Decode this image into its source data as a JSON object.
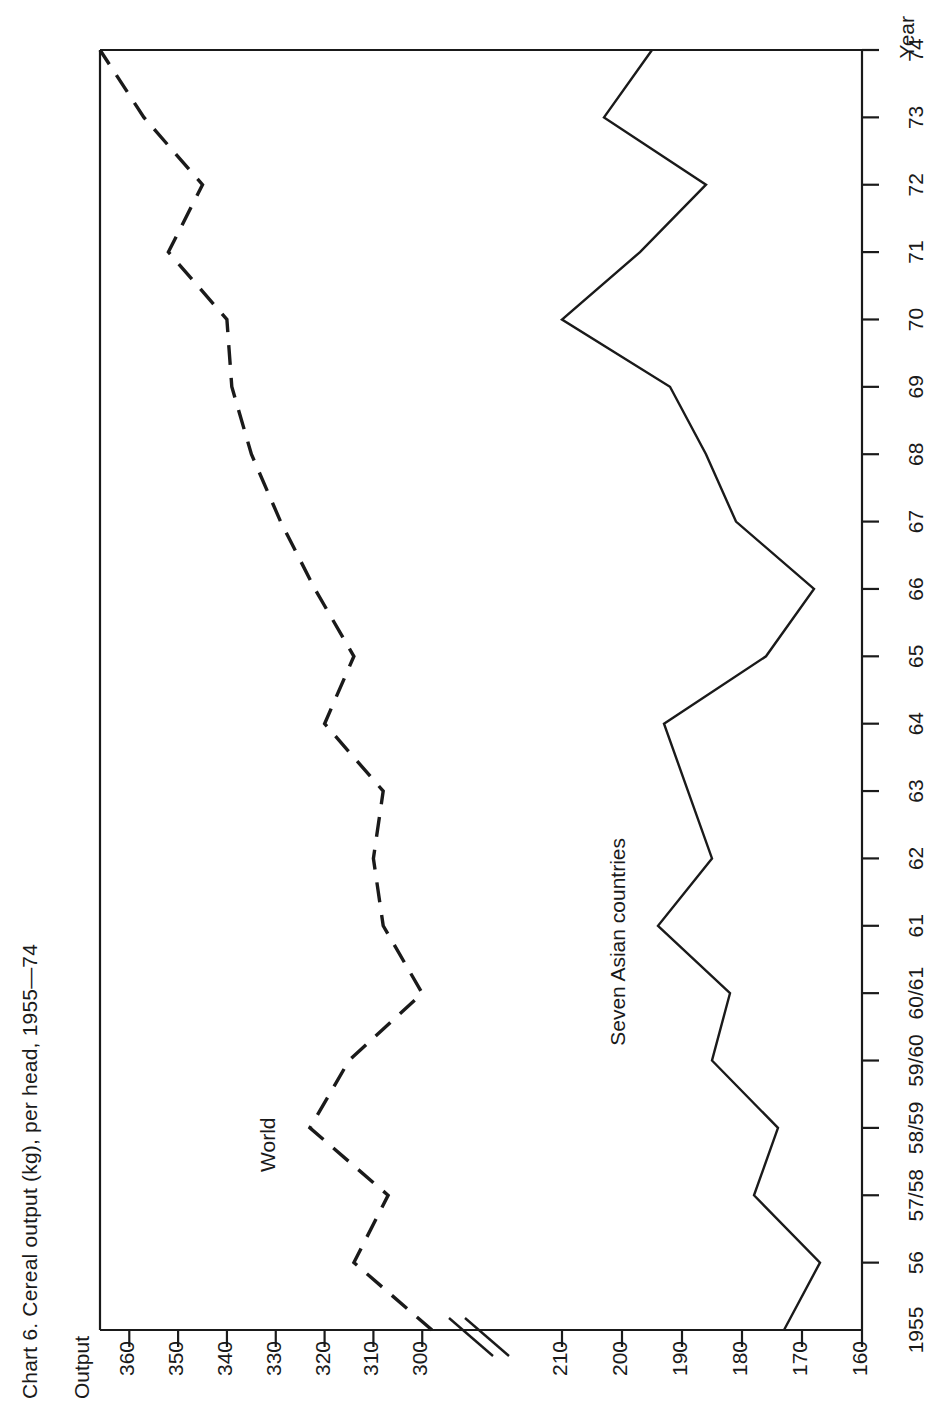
{
  "title": "Chart 6.  Cereal output (kg), per head, 1955—74",
  "axis": {
    "y_title": "Output",
    "x_title": "Year",
    "y_ticks_upper": [
      "360",
      "350",
      "340",
      "330",
      "320",
      "310",
      "300"
    ],
    "y_ticks_lower": [
      "210",
      "200",
      "190",
      "180",
      "170",
      "160"
    ],
    "x_ticks": [
      "1955",
      "56",
      "57/58",
      "58/59",
      "59/60",
      "60/61",
      "61",
      "62",
      "63",
      "64",
      "65",
      "66",
      "67",
      "68",
      "69",
      "70",
      "71",
      "72",
      "73",
      "74"
    ],
    "break_marker": "//"
  },
  "series_labels": {
    "world": "World",
    "asia": "Seven Asian countries"
  },
  "colors": {
    "ink": "#1a1a1a",
    "background": "#ffffff"
  },
  "chart_data": {
    "type": "line",
    "title": "Chart 6.  Cereal output (kg), per head, 1955—74",
    "xlabel": "Year",
    "ylabel": "Output",
    "grid": false,
    "legend": "inline-labels",
    "note": "Y axis is broken between 300 and 210 kg; upper band 300-365 serves the World series, lower band 160-215 serves the Seven Asian countries series.",
    "axis_break": {
      "below": 210,
      "above": 300
    },
    "ylim_upper": [
      298,
      366
    ],
    "ylim_lower": [
      160,
      215
    ],
    "categories": [
      "1955",
      "56",
      "57/58",
      "58/59",
      "59/60",
      "60/61",
      "61",
      "62",
      "63",
      "64",
      "65",
      "66",
      "67",
      "68",
      "69",
      "70",
      "71",
      "72",
      "73",
      "74"
    ],
    "series": [
      {
        "name": "World",
        "style": "dashed",
        "unit": "kg per head",
        "values": [
          298,
          314,
          307,
          323,
          315,
          300,
          308,
          310,
          308,
          320,
          314,
          322,
          329,
          335,
          339,
          340,
          352,
          345,
          357,
          366
        ]
      },
      {
        "name": "Seven Asian countries",
        "style": "solid",
        "unit": "kg per head",
        "values": [
          173,
          167,
          178,
          174,
          185,
          182,
          194,
          185,
          189,
          193,
          176,
          168,
          181,
          186,
          192,
          210,
          197,
          186,
          203,
          195
        ]
      }
    ]
  }
}
